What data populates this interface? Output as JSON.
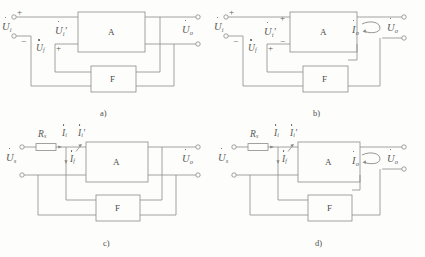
{
  "figure": {
    "stroke_color": "#8a8a8a",
    "text_color": "#5a5a5a",
    "background_color": "#fdfdfb"
  },
  "blocks": {
    "amplifier_label": "A",
    "feedback_label": "F"
  },
  "panels": [
    {
      "id": "a",
      "caption": "a)",
      "topology": "voltage-series (series-shunt)",
      "labels": {
        "input_voltage": "U",
        "input_voltage_sub": "i",
        "input_sign_plus": "+",
        "input_sign_minus": "−",
        "net_input_voltage": "U",
        "net_input_voltage_sub": "i",
        "net_input_voltage_prime": "′",
        "feedback_voltage": "U",
        "feedback_voltage_sub": "f",
        "feedback_sign_plus": "+",
        "output_voltage": "U",
        "output_voltage_sub": "o"
      }
    },
    {
      "id": "b",
      "caption": "b)",
      "topology": "current-series (series-series)",
      "labels": {
        "input_voltage": "U",
        "input_voltage_sub": "i",
        "input_sign_plus": "+",
        "input_sign_minus": "−",
        "net_input_voltage": "U",
        "net_input_voltage_sub": "i",
        "net_input_voltage_prime": "′",
        "net_input_sign_plus": "+",
        "net_input_sign_minus": "−",
        "feedback_voltage": "U",
        "feedback_voltage_sub": "f",
        "feedback_sign_plus": "+",
        "output_current": "I",
        "output_current_sub": "o",
        "output_voltage": "U",
        "output_voltage_sub": "o"
      }
    },
    {
      "id": "c",
      "caption": "c)",
      "topology": "voltage-shunt (shunt-shunt)",
      "labels": {
        "source_resistor": "R",
        "source_resistor_sub": "s",
        "source_voltage": "U",
        "source_voltage_sub": "s",
        "source_current": "I",
        "source_current_sub": "i",
        "net_input_current": "I",
        "net_input_current_sub": "i",
        "net_input_current_prime": "′",
        "feedback_current": "I",
        "feedback_current_sub": "f",
        "output_voltage": "U",
        "output_voltage_sub": "o"
      }
    },
    {
      "id": "d",
      "caption": "d)",
      "topology": "current-shunt (shunt-series)",
      "labels": {
        "source_resistor": "R",
        "source_resistor_sub": "s",
        "source_voltage": "U",
        "source_voltage_sub": "s",
        "source_current": "I",
        "source_current_sub": "i",
        "net_input_current": "I",
        "net_input_current_sub": "i",
        "net_input_current_prime": "′",
        "feedback_current": "I",
        "feedback_current_sub": "f",
        "output_current": "I",
        "output_current_sub": "o",
        "output_voltage": "U",
        "output_voltage_sub": "o"
      }
    }
  ]
}
